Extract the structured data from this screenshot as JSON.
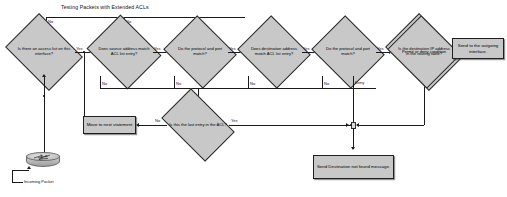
{
  "title": "Testing Packets with Extended ACLs",
  "nodes": {
    "d1": "Is there an access list on this interface?",
    "d2": "Does source address match ACL list entry?",
    "d3": "Do the protocol and port match?",
    "d4": "Does destination address match ACL list entry?",
    "d5": "Do the protocol and port match?",
    "d6": "Permit or deny condition",
    "d7": "Is the destination IP address in the routing table?",
    "d8": "Is this the last entry in the ACL?",
    "box_outgoing": "Send to the outgoing interface.",
    "box_move": "Move to next statement",
    "box_notfound": "Send Destination not found message."
  },
  "edge_labels": {
    "no_top_1": "No",
    "no_top_2": "No",
    "yes_1": "Yes",
    "yes_2": "Yes",
    "yes_3": "Yes",
    "yes_4": "Yes",
    "yes_5": "Yes",
    "yes_6": "Yes",
    "yes_7": "Yes",
    "no_bottom_2": "No",
    "no_bottom_3": "No",
    "no_bottom_4": "No",
    "no_bottom_5": "No",
    "deny": "Deny",
    "no_routing": "No",
    "no_last": "No",
    "yes_last": "Yes"
  },
  "icons": {
    "router_label": "Incoming Packet",
    "router_icon": "router-icon"
  },
  "colors": {
    "node_fill": "#c8c8c8",
    "stroke": "#1a1a1a",
    "background": "#ffffff"
  }
}
